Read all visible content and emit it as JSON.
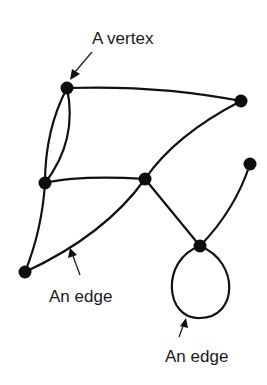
{
  "diagram": {
    "type": "graph",
    "labels": {
      "vertex_label": "A vertex",
      "edge_label_1": "An edge",
      "edge_label_2": "An edge"
    },
    "vertices": [
      {
        "id": "v1",
        "x": 67,
        "y": 88
      },
      {
        "id": "v2",
        "x": 241,
        "y": 101
      },
      {
        "id": "v3",
        "x": 45,
        "y": 183
      },
      {
        "id": "v4",
        "x": 145,
        "y": 179
      },
      {
        "id": "v5",
        "x": 250,
        "y": 164
      },
      {
        "id": "v6",
        "x": 200,
        "y": 246
      },
      {
        "id": "v7",
        "x": 25,
        "y": 272
      }
    ],
    "edges": [
      {
        "from": "v1",
        "to": "v2"
      },
      {
        "from": "v1",
        "to": "v3",
        "note": "left of double edge"
      },
      {
        "from": "v1",
        "to": "v3",
        "note": "right of double edge"
      },
      {
        "from": "v3",
        "to": "v4"
      },
      {
        "from": "v2",
        "to": "v4"
      },
      {
        "from": "v3",
        "to": "v7"
      },
      {
        "from": "v7",
        "to": "v4"
      },
      {
        "from": "v4",
        "to": "v6"
      },
      {
        "from": "v5",
        "to": "v6"
      },
      {
        "from": "v6",
        "to": "v6",
        "note": "loop"
      }
    ],
    "colors": {
      "stroke": "#111111",
      "background": "#ffffff"
    }
  }
}
